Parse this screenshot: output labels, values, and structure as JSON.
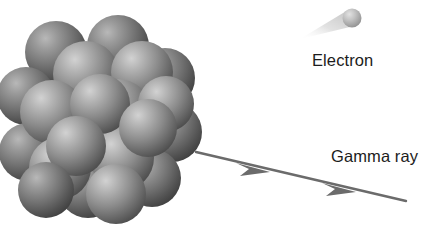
{
  "figure": {
    "background_color": "#ffffff",
    "width": 432,
    "height": 233
  },
  "labels": {
    "electron": "Electron",
    "gamma_ray": "Gamma ray",
    "text_color": "#1c1c1c"
  },
  "nucleus": {
    "name": "atomic-nucleus",
    "description": "Cluster of shaded spheres representing nucleons",
    "sphere_count": 20,
    "sphere_light_color": "#c9c9c9",
    "sphere_mid_color": "#8a8a8a",
    "sphere_dark_color": "#4a4a4a",
    "bounds": {
      "x": 5,
      "y": 22,
      "width": 186,
      "height": 198
    }
  },
  "electron": {
    "name": "electron-particle",
    "sphere_color": "#b5b5b5",
    "trail_color": "#d6d6d6",
    "position": {
      "cx": 352,
      "cy": 18,
      "r": 9
    },
    "trail_from": {
      "x": 300,
      "y": 36
    }
  },
  "gamma_ray": {
    "name": "gamma-ray-arrow",
    "line_color": "#6b6b6b",
    "stroke_width": 2.4,
    "start": {
      "x": 196,
      "y": 152
    },
    "end": {
      "x": 406,
      "y": 201
    },
    "arrowheads": 2
  }
}
